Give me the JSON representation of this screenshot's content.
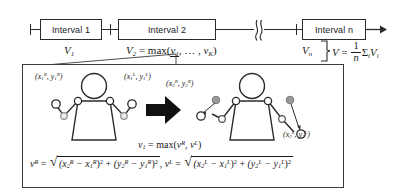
{
  "figure": {
    "type": "diagram",
    "timeline": {
      "boxes": [
        {
          "label": "Interval 1",
          "value_label": "V",
          "value_sub": "1"
        },
        {
          "label": "Interval 2",
          "value_label": "V",
          "value_sub": "2"
        },
        {
          "label": "Interval n",
          "value_label": "V",
          "value_sub": "n"
        }
      ],
      "break_symbol": "≈",
      "interval2_formula": {
        "lhs": "V",
        "lhs_sub": "2",
        "eq": "=",
        "fn": "max",
        "open": "(",
        "arg1": "v",
        "arg1_sub": "1",
        "ellipsis": ", … ,",
        "argk": "v",
        "argk_sub": "K",
        "close": ")"
      },
      "average_formula": {
        "lhs": "V",
        "eq": "=",
        "frac_num": "1",
        "frac_den": "n",
        "sigma": "Σ",
        "sigma_sub": "i",
        "term": "V",
        "term_sub": "i"
      }
    },
    "detail_box": {
      "left_pose_labels": [
        {
          "text": "(x",
          "sub": "1",
          "sup": "R",
          "text2": ", y",
          "sub2": "1",
          "sup2": "R",
          "text3": ")"
        },
        {
          "text": "(x",
          "sub": "1",
          "sup": "L",
          "text2": ", y",
          "sub2": "1",
          "sup2": "L",
          "text3": ")"
        }
      ],
      "right_pose_labels": [
        {
          "text": "(x",
          "sub": "2",
          "sup": "R",
          "text2": ", y",
          "sub2": "2",
          "sup2": "R",
          "text3": ")"
        },
        {
          "text": "(x",
          "sub": "2",
          "sup": "L",
          "text2": ", y",
          "sub2": "2",
          "sup2": "L",
          "text3": ")"
        }
      ],
      "max_formula": {
        "lhs": "v",
        "lhs_sub": "1",
        "eq": "=",
        "fn": "max",
        "open": "(",
        "argR": "v",
        "argR_sup": "R",
        "comma": ", ",
        "argL": "v",
        "argL_sup": "L",
        "close": ")"
      },
      "distance_formula": {
        "lhsR": "v",
        "lhsR_sup": "R",
        "eqR": "=",
        "R_t1_open": "(x",
        "R_t1_sub": "2",
        "R_t1_sup": "R",
        "R_t1_minus": " − x",
        "R_t1_sub2": "1",
        "R_t1_sup2": "R",
        "R_t1_close": ")",
        "R_t1_pow": "2",
        "plus": " + ",
        "R_t2_open": "(y",
        "R_t2_sub": "2",
        "R_t2_sup": "R",
        "R_t2_minus": " − y",
        "R_t2_sub2": "1",
        "R_t2_sup2": "R",
        "R_t2_close": ")",
        "R_t2_pow": "2",
        "sep": ", ",
        "lhsL": "v",
        "lhsL_sup": "L",
        "eqL": "=",
        "L_t1_open": "(x",
        "L_t1_sub": "2",
        "L_t1_sup": "L",
        "L_t1_minus": " − x",
        "L_t1_sub2": "1",
        "L_t1_sup2": "L",
        "L_t1_close": ")",
        "L_t1_pow": "2",
        "L_t2_open": "(y",
        "L_t2_sub": "2",
        "L_t2_sup": "L",
        "L_t2_minus": " − y",
        "L_t2_sub2": "1",
        "L_t2_sup2": "L",
        "L_t2_close": ")",
        "L_t2_pow": "2",
        "radical": "√"
      }
    },
    "colors": {
      "stroke": "#2b2b2b",
      "arrow_fill": "#111111",
      "joint_fill": "#ffffff",
      "ghost_joint_fill": "#9a9a9a",
      "background": "#ffffff"
    }
  }
}
